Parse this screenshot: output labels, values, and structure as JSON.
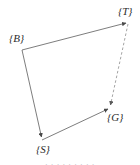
{
  "figure": {
    "type": "frame-transform-quadrilateral",
    "background_color": "#ffffff",
    "stroke_color": "#6e6e6e",
    "dashed_stroke_color": "#9a9a9a",
    "label_color": "#2b2b2b",
    "vertices": [
      {
        "id": "B",
        "label": "{B}",
        "x": 22,
        "y": 50,
        "label_x": 9,
        "label_y": 32
      },
      {
        "id": "T",
        "label": "{T}",
        "x": 128,
        "y": 22,
        "label_x": 118,
        "label_y": 5
      },
      {
        "id": "G",
        "label": "{G}",
        "x": 110,
        "y": 108,
        "label_x": 107,
        "label_y": 111
      },
      {
        "id": "S",
        "label": "{S}",
        "x": 42,
        "y": 140,
        "label_x": 36,
        "label_y": 143
      }
    ],
    "edges": [
      {
        "from": "B",
        "to": "T",
        "style": "solid",
        "arrowhead": "end"
      },
      {
        "from": "B",
        "to": "S",
        "style": "solid",
        "arrowhead": "end"
      },
      {
        "from": "S",
        "to": "G",
        "style": "solid",
        "arrowhead": "end"
      },
      {
        "from": "T",
        "to": "G",
        "style": "dashed",
        "arrowhead": "end"
      }
    ]
  },
  "bleed": {
    "top_text": "· · · · · · · · · · · ·",
    "bottom_text": "· · · · · · · · ·"
  }
}
